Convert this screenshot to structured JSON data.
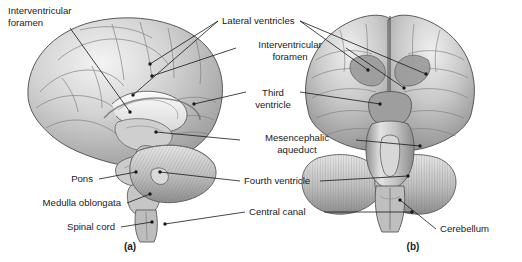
{
  "figure": {
    "background_color": "#ffffff",
    "ink_color": "#15181c",
    "style": "grayscale anatomical illustration"
  },
  "panels": [
    {
      "id": "a",
      "label": "(a)",
      "view": "left lateral / midsagittal section",
      "x": 130,
      "y": 250
    },
    {
      "id": "b",
      "label": "(b)",
      "view": "posterior view",
      "x": 413,
      "y": 250
    }
  ],
  "labels": [
    {
      "id": "interventricular-foramen-left",
      "lines": [
        "Interventricular",
        "foramen"
      ],
      "anchor": "start",
      "x": 8,
      "y": 14,
      "line_height": 12
    },
    {
      "id": "lateral-ventricles",
      "lines": [
        "Lateral ventricles"
      ],
      "anchor": "start",
      "x": 222,
      "y": 24,
      "line_height": 12
    },
    {
      "id": "interventricular-foramen-center",
      "lines": [
        "Interventricular",
        "foramen"
      ],
      "anchor": "middle",
      "x": 290,
      "y": 48,
      "line_height": 12
    },
    {
      "id": "third-ventricle",
      "lines": [
        "Third",
        "ventricle"
      ],
      "anchor": "middle",
      "x": 273,
      "y": 96,
      "line_height": 12
    },
    {
      "id": "mesencephalic-aqueduct",
      "lines": [
        "Mesencephalic",
        "aqueduct"
      ],
      "anchor": "middle",
      "x": 297,
      "y": 141,
      "line_height": 12
    },
    {
      "id": "pons",
      "lines": [
        "Pons"
      ],
      "anchor": "end",
      "x": 93,
      "y": 182,
      "line_height": 12
    },
    {
      "id": "fourth-ventricle",
      "lines": [
        "Fourth ventricle"
      ],
      "anchor": "start",
      "x": 244,
      "y": 184,
      "line_height": 12
    },
    {
      "id": "medulla-oblongata",
      "lines": [
        "Medulla oblongata"
      ],
      "anchor": "end",
      "x": 121,
      "y": 206,
      "line_height": 12
    },
    {
      "id": "central-canal",
      "lines": [
        "Central canal"
      ],
      "anchor": "start",
      "x": 249,
      "y": 215,
      "line_height": 12
    },
    {
      "id": "spinal-cord",
      "lines": [
        "Spinal cord"
      ],
      "anchor": "end",
      "x": 115,
      "y": 230,
      "line_height": 12
    },
    {
      "id": "cerebellum",
      "lines": [
        "Cerebellum"
      ],
      "anchor": "start",
      "x": 440,
      "y": 232,
      "line_height": 12
    }
  ],
  "leaders": [
    {
      "id": "interventricular-foramen-left-leader",
      "points": "70,28 130,112",
      "dot": [
        130,
        112
      ]
    },
    {
      "id": "lateral-ventricles-leader-1",
      "points": "218,21 150,64",
      "dot": [
        150,
        64
      ]
    },
    {
      "id": "lateral-ventricles-leader-2",
      "points": "218,21 133,95",
      "dot": [
        133,
        95
      ]
    },
    {
      "id": "lateral-ventricles-leader-3",
      "points": "300,21 368,70",
      "dot": [
        368,
        70
      ]
    },
    {
      "id": "lateral-ventricles-leader-4",
      "points": "300,21 426,74",
      "dot": [
        426,
        74
      ]
    },
    {
      "id": "interventricular-foramen-center-leader-l",
      "points": "236,48 152,76",
      "dot": [
        152,
        76
      ]
    },
    {
      "id": "interventricular-foramen-center-leader-r",
      "points": "346,48 404,88",
      "dot": [
        404,
        88
      ]
    },
    {
      "id": "third-ventricle-leader-l",
      "points": "246,92 194,104",
      "dot": [
        194,
        104
      ]
    },
    {
      "id": "third-ventricle-leader-r",
      "points": "300,92 380,104",
      "dot": [
        380,
        104
      ]
    },
    {
      "id": "mesencephalic-aqueduct-leader-l",
      "points": "240,140 156,132",
      "dot": [
        156,
        132
      ]
    },
    {
      "id": "mesencephalic-aqueduct-leader-r",
      "points": "356,140 420,146",
      "dot": [
        420,
        146
      ]
    },
    {
      "id": "pons-leader",
      "points": "99,179 136,172",
      "dot": [
        136,
        172
      ]
    },
    {
      "id": "fourth-ventricle-leader-l",
      "points": "240,181 160,172",
      "dot": [
        160,
        172
      ]
    },
    {
      "id": "fourth-ventricle-leader-r",
      "points": "320,181 408,176",
      "dot": [
        408,
        176
      ]
    },
    {
      "id": "medulla-oblongata-leader",
      "points": "127,203 150,194",
      "dot": [
        150,
        194
      ]
    },
    {
      "id": "central-canal-leader-l",
      "points": "245,212 165,224",
      "dot": [
        165,
        224
      ]
    },
    {
      "id": "central-canal-leader-r",
      "points": "324,212 412,212",
      "dot": [
        412,
        212
      ]
    },
    {
      "id": "spinal-cord-leader",
      "points": "121,227 152,222",
      "dot": [
        152,
        222
      ]
    },
    {
      "id": "cerebellum-leader",
      "points": "436,229 400,200",
      "dot": [
        400,
        200
      ]
    }
  ]
}
